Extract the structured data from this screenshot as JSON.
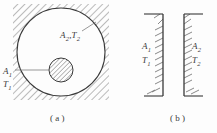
{
  "figure": {
    "stroke_color": "#3a3a3a",
    "hatch_color": "#6b6b6b",
    "background_color": "#fdfdfd",
    "panel_a": {
      "caption": "( a )",
      "outer_label": "A₂,T₂",
      "outer_label_parts": {
        "area": "A",
        "area_sub": "2",
        "temp": "T",
        "temp_sub": "2"
      },
      "inner_area_label": "A",
      "inner_area_sub": "1",
      "inner_temp_label": "T",
      "inner_temp_sub": "1"
    },
    "panel_b": {
      "caption": "( b )",
      "left_wall": {
        "area_label": "A",
        "area_sub": "1",
        "temp_label": "T",
        "temp_sub": "1"
      },
      "right_wall": {
        "area_label": "A",
        "area_sub": "2",
        "temp_label": "T",
        "temp_sub": "2"
      }
    }
  }
}
